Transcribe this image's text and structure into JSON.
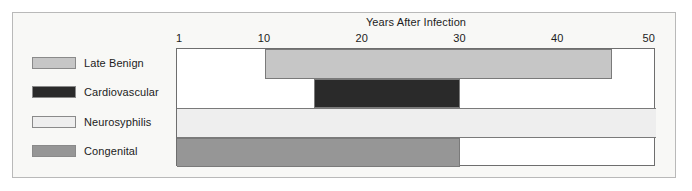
{
  "figure": {
    "background": "#f8f8f6",
    "frame_color": "#b9b9b9"
  },
  "legend": {
    "items": [
      {
        "label": "Late Benign",
        "color": "#c6c6c6"
      },
      {
        "label": "Cardiovascular",
        "color": "#2a2a2a"
      },
      {
        "label": "Neurosyphilis",
        "color": "#eeeeee"
      },
      {
        "label": "Congenital",
        "color": "#969696"
      }
    ]
  },
  "chart_data": {
    "type": "bar",
    "orientation": "horizontal",
    "title": "Years After Infection",
    "xlabel": "Years After Infection",
    "ylabel": "",
    "xlim": [
      1,
      50
    ],
    "tick_labels": [
      "1",
      "10",
      "20",
      "30",
      "40",
      "50"
    ],
    "tick_values": [
      1,
      10,
      20,
      30,
      40,
      50
    ],
    "grid": false,
    "legend_position": "left",
    "categories": [
      "Late Benign",
      "Cardiovascular",
      "Neurosyphilis",
      "Congenital"
    ],
    "series": [
      {
        "name": "Late Benign",
        "start": 10,
        "end": 45.5,
        "color": "#c6c6c6"
      },
      {
        "name": "Cardiovascular",
        "start": 15,
        "end": 30,
        "color": "#2a2a2a"
      },
      {
        "name": "Neurosyphilis",
        "start": 1,
        "end": 50,
        "color": "#eeeeee"
      },
      {
        "name": "Congenital",
        "start": 1,
        "end": 30,
        "color": "#969696"
      }
    ]
  }
}
